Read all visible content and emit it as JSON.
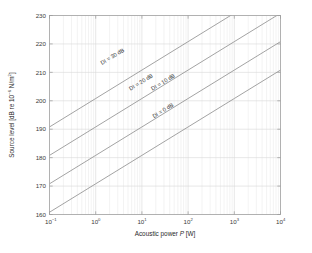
{
  "chart_data": {
    "type": "line",
    "title": "",
    "xlabel": "Acoustic power P [W]",
    "xlabel_parts": {
      "pre": "Acoustic power ",
      "italic": "P",
      "post": " [W]"
    },
    "ylabel": "Source level [dB re 10-6 N/m2]",
    "ylabel_parts": {
      "pre": "Source level [dB re 10",
      "sup1": "−6",
      "mid": " N/m",
      "sup2": "2",
      "post": "]"
    },
    "xscale": "log",
    "yscale": "linear",
    "xlim": [
      0.1,
      10000
    ],
    "ylim": [
      160,
      230
    ],
    "grid": true,
    "legend": "none",
    "x_ticks": [
      {
        "value": 0.1,
        "base": "10",
        "exp": "−1"
      },
      {
        "value": 1,
        "base": "10",
        "exp": "0"
      },
      {
        "value": 10,
        "base": "10",
        "exp": "1"
      },
      {
        "value": 100,
        "base": "10",
        "exp": "2"
      },
      {
        "value": 1000,
        "base": "10",
        "exp": "3"
      },
      {
        "value": 10000,
        "base": "10",
        "exp": "4"
      }
    ],
    "y_ticks": [
      160,
      170,
      180,
      190,
      200,
      210,
      220,
      230
    ],
    "x": [
      0.1,
      1,
      10,
      100,
      1000,
      10000
    ],
    "series": [
      {
        "name": "DI = 0 dB",
        "label": "DI = 0 dB",
        "di": 0,
        "color": "#8c8c8c",
        "values": [
          160.8,
          170.8,
          180.8,
          190.8,
          200.8,
          210.8
        ],
        "label_at_x": 30,
        "label_at_y": 196
      },
      {
        "name": "DI = 10 dB",
        "label": "DI = 10 dB",
        "di": 10,
        "color": "#8c8c8c",
        "values": [
          170.8,
          180.8,
          190.8,
          200.8,
          210.8,
          220.8
        ],
        "label_at_x": 30,
        "label_at_y": 206
      },
      {
        "name": "DI = 20 dB",
        "label": "DI = 20 dB",
        "di": 20,
        "color": "#8c8c8c",
        "values": [
          180.8,
          190.8,
          200.8,
          210.8,
          220.8,
          230.8
        ],
        "label_at_x": 10,
        "label_at_y": 206
      },
      {
        "name": "DI = 30 dB",
        "label": "DI = 30 dB",
        "di": 30,
        "color": "#8c8c8c",
        "values": [
          190.8,
          200.8,
          210.8,
          220.8,
          230.8,
          240.8
        ],
        "label_at_x": 2.4,
        "label_at_y": 215
      }
    ],
    "annotation": "Source level increases 10 dB per decade of acoustic power; each curve is offset by its directivity index DI."
  },
  "colors": {
    "axis": "#9a9a9a",
    "grid": "#d6d6d6",
    "line": "#8c8c8c",
    "text": "#2a2a2a",
    "background": "#ffffff"
  }
}
